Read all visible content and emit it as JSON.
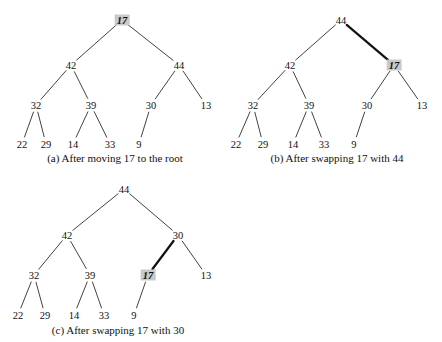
{
  "figure": {
    "background_color": "#ffffff",
    "ink_color": "#111111",
    "highlight_color": "#c9c9c9",
    "panels": [
      {
        "id": "panel-a",
        "caption": "(a) After moving 17 to the root",
        "caption_x": 115,
        "caption_y": 152,
        "origin_x": 0,
        "origin_y": 0,
        "width": 221,
        "height": 171,
        "nodes": [
          {
            "id": "a-root",
            "label": "17",
            "x": 122,
            "y": 20,
            "highlight": true
          },
          {
            "id": "a-n42",
            "label": "42",
            "x": 71,
            "y": 65,
            "highlight": false
          },
          {
            "id": "a-n44",
            "label": "44",
            "x": 179,
            "y": 65,
            "highlight": false
          },
          {
            "id": "a-n32",
            "label": "32",
            "x": 36,
            "y": 105,
            "highlight": false
          },
          {
            "id": "a-n39",
            "label": "39",
            "x": 91,
            "y": 105,
            "highlight": false
          },
          {
            "id": "a-n30",
            "label": "30",
            "x": 151,
            "y": 105,
            "highlight": false
          },
          {
            "id": "a-n13",
            "label": "13",
            "x": 206,
            "y": 105,
            "highlight": false
          },
          {
            "id": "a-n22",
            "label": "22",
            "x": 22,
            "y": 144,
            "highlight": false
          },
          {
            "id": "a-n29",
            "label": "29",
            "x": 46,
            "y": 144,
            "highlight": false
          },
          {
            "id": "a-n14",
            "label": "14",
            "x": 73,
            "y": 144,
            "highlight": false
          },
          {
            "id": "a-n33",
            "label": "33",
            "x": 110,
            "y": 144,
            "highlight": false
          },
          {
            "id": "a-n9",
            "label": "9",
            "x": 139,
            "y": 144,
            "highlight": false
          }
        ],
        "edges": [
          {
            "from": "a-root",
            "to": "a-n42",
            "bold": false
          },
          {
            "from": "a-root",
            "to": "a-n44",
            "bold": false
          },
          {
            "from": "a-n42",
            "to": "a-n32",
            "bold": false
          },
          {
            "from": "a-n42",
            "to": "a-n39",
            "bold": false
          },
          {
            "from": "a-n44",
            "to": "a-n30",
            "bold": false
          },
          {
            "from": "a-n44",
            "to": "a-n13",
            "bold": false
          },
          {
            "from": "a-n32",
            "to": "a-n22",
            "bold": false
          },
          {
            "from": "a-n32",
            "to": "a-n29",
            "bold": false
          },
          {
            "from": "a-n39",
            "to": "a-n14",
            "bold": false
          },
          {
            "from": "a-n39",
            "to": "a-n33",
            "bold": false
          },
          {
            "from": "a-n30",
            "to": "a-n9",
            "bold": false
          }
        ]
      },
      {
        "id": "panel-b",
        "caption": "(b) After swapping 17 with 44",
        "caption_x": 337,
        "caption_y": 152,
        "origin_x": 221,
        "origin_y": 0,
        "width": 221,
        "height": 171,
        "nodes": [
          {
            "id": "b-root",
            "label": "44",
            "x": 120,
            "y": 20,
            "highlight": false
          },
          {
            "id": "b-n42",
            "label": "42",
            "x": 69,
            "y": 65,
            "highlight": false
          },
          {
            "id": "b-n17",
            "label": "17",
            "x": 173,
            "y": 65,
            "highlight": true
          },
          {
            "id": "b-n32",
            "label": "32",
            "x": 32,
            "y": 105,
            "highlight": false
          },
          {
            "id": "b-n39",
            "label": "39",
            "x": 88,
            "y": 105,
            "highlight": false
          },
          {
            "id": "b-n30",
            "label": "30",
            "x": 146,
            "y": 105,
            "highlight": false
          },
          {
            "id": "b-n13",
            "label": "13",
            "x": 201,
            "y": 105,
            "highlight": false
          },
          {
            "id": "b-n22",
            "label": "22",
            "x": 15,
            "y": 144,
            "highlight": false
          },
          {
            "id": "b-n29",
            "label": "29",
            "x": 42,
            "y": 144,
            "highlight": false
          },
          {
            "id": "b-n14",
            "label": "14",
            "x": 72,
            "y": 144,
            "highlight": false
          },
          {
            "id": "b-n33",
            "label": "33",
            "x": 103,
            "y": 144,
            "highlight": false
          },
          {
            "id": "b-n9",
            "label": "9",
            "x": 133,
            "y": 144,
            "highlight": false
          }
        ],
        "edges": [
          {
            "from": "b-root",
            "to": "b-n42",
            "bold": false
          },
          {
            "from": "b-root",
            "to": "b-n17",
            "bold": true
          },
          {
            "from": "b-n42",
            "to": "b-n32",
            "bold": false
          },
          {
            "from": "b-n42",
            "to": "b-n39",
            "bold": false
          },
          {
            "from": "b-n17",
            "to": "b-n30",
            "bold": false
          },
          {
            "from": "b-n17",
            "to": "b-n13",
            "bold": false
          },
          {
            "from": "b-n32",
            "to": "b-n22",
            "bold": false
          },
          {
            "from": "b-n32",
            "to": "b-n29",
            "bold": false
          },
          {
            "from": "b-n39",
            "to": "b-n14",
            "bold": false
          },
          {
            "from": "b-n39",
            "to": "b-n33",
            "bold": false
          },
          {
            "from": "b-n30",
            "to": "b-n9",
            "bold": false
          }
        ]
      },
      {
        "id": "panel-c",
        "caption": "(c) After swapping 17 with 30",
        "caption_x": 118,
        "caption_y": 324,
        "origin_x": 0,
        "origin_y": 172,
        "width": 225,
        "height": 170,
        "nodes": [
          {
            "id": "c-root",
            "label": "44",
            "x": 124,
            "y": 17,
            "highlight": false
          },
          {
            "id": "c-n42",
            "label": "42",
            "x": 67,
            "y": 63,
            "highlight": false
          },
          {
            "id": "c-n30",
            "label": "30",
            "x": 178,
            "y": 63,
            "highlight": false
          },
          {
            "id": "c-n32",
            "label": "32",
            "x": 34,
            "y": 103,
            "highlight": false
          },
          {
            "id": "c-n39",
            "label": "39",
            "x": 90,
            "y": 103,
            "highlight": false
          },
          {
            "id": "c-n17",
            "label": "17",
            "x": 148,
            "y": 103,
            "highlight": true
          },
          {
            "id": "c-n13",
            "label": "13",
            "x": 206,
            "y": 103,
            "highlight": false
          },
          {
            "id": "c-n22",
            "label": "22",
            "x": 18,
            "y": 143,
            "highlight": false
          },
          {
            "id": "c-n29",
            "label": "29",
            "x": 45,
            "y": 143,
            "highlight": false
          },
          {
            "id": "c-n14",
            "label": "14",
            "x": 74,
            "y": 143,
            "highlight": false
          },
          {
            "id": "c-n33",
            "label": "33",
            "x": 104,
            "y": 143,
            "highlight": false
          },
          {
            "id": "c-n9",
            "label": "9",
            "x": 134,
            "y": 143,
            "highlight": false
          }
        ],
        "edges": [
          {
            "from": "c-root",
            "to": "c-n42",
            "bold": false
          },
          {
            "from": "c-root",
            "to": "c-n30",
            "bold": false
          },
          {
            "from": "c-n42",
            "to": "c-n32",
            "bold": false
          },
          {
            "from": "c-n42",
            "to": "c-n39",
            "bold": false
          },
          {
            "from": "c-n30",
            "to": "c-n17",
            "bold": true
          },
          {
            "from": "c-n30",
            "to": "c-n13",
            "bold": false
          },
          {
            "from": "c-n32",
            "to": "c-n22",
            "bold": false
          },
          {
            "from": "c-n32",
            "to": "c-n29",
            "bold": false
          },
          {
            "from": "c-n39",
            "to": "c-n14",
            "bold": false
          },
          {
            "from": "c-n39",
            "to": "c-n33",
            "bold": false
          },
          {
            "from": "c-n17",
            "to": "c-n9",
            "bold": false
          }
        ]
      }
    ]
  }
}
